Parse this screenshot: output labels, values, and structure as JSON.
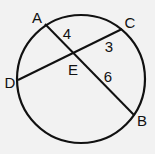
{
  "diagram": {
    "type": "circle-intersecting-chords",
    "stroke_color": "#111111",
    "background_color": "#f2f2f2",
    "circle": {
      "cx": 81,
      "cy": 79,
      "r": 64
    },
    "points": {
      "A": {
        "label": "A",
        "x": 45,
        "y": 24,
        "lx": 37,
        "ly": 23
      },
      "B": {
        "label": "B",
        "x": 134,
        "y": 115,
        "lx": 142,
        "ly": 126
      },
      "C": {
        "label": "C",
        "x": 122,
        "y": 29,
        "lx": 130,
        "ly": 28
      },
      "D": {
        "label": "D",
        "x": 18,
        "y": 80,
        "lx": 10,
        "ly": 88
      },
      "E": {
        "label": "E",
        "x": 73,
        "y": 52,
        "lx": 73,
        "ly": 75
      }
    },
    "chords": [
      {
        "from": "A",
        "to": "B"
      },
      {
        "from": "D",
        "to": "C"
      }
    ],
    "segment_labels": {
      "AE": {
        "text": "4",
        "x": 67,
        "y": 39
      },
      "EC": {
        "text": "3",
        "x": 109,
        "y": 52
      },
      "EB": {
        "text": "6",
        "x": 108,
        "y": 82
      }
    }
  }
}
